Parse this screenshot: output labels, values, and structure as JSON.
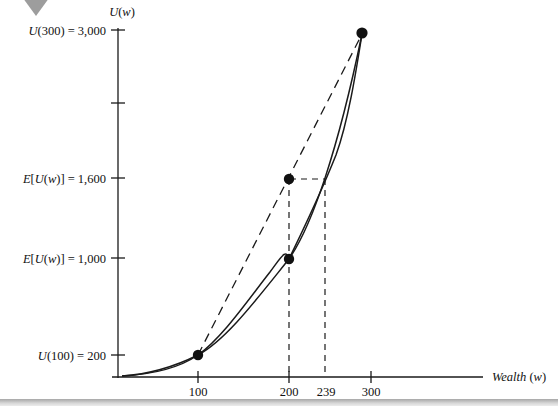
{
  "figure": {
    "decor": {
      "corner_marker": "triangle-down-marker",
      "corner_marker_color": "#9a9a9a",
      "bottom_rule_color": "#b4b4b4"
    },
    "axes": {
      "y_title": "U(w)",
      "x_title": "Wealth (w)",
      "axis_color": "#1a1a1a"
    },
    "y_labels": [
      {
        "id": "u300",
        "text": "U(300) = 3,000",
        "value": 3000
      },
      {
        "id": "eu1600",
        "text": "E[U(w)] = 1,600",
        "value": 1600
      },
      {
        "id": "eu1000",
        "text": "E[U(w)] = 1,000",
        "value": 1000
      },
      {
        "id": "u100",
        "text": "U(100) = 200",
        "value": 200
      }
    ],
    "x_labels": [
      {
        "id": "x100",
        "text": "100",
        "value": 100
      },
      {
        "id": "x200",
        "text": "200",
        "value": 200
      },
      {
        "id": "x239",
        "text": "239",
        "value": 239
      },
      {
        "id": "x300",
        "text": "300",
        "value": 300
      }
    ]
  },
  "chart_data": {
    "type": "line",
    "title": "",
    "subtitle": "",
    "xlabel": "Wealth (w)",
    "ylabel": "U(w)",
    "xlim": [
      0,
      420
    ],
    "ylim": [
      0,
      3300
    ],
    "grid": false,
    "legend": "none",
    "x_ticks": [
      100,
      200,
      300
    ],
    "x_tick_labels": [
      "100",
      "200",
      "300"
    ],
    "y_ticks": [
      200,
      1000,
      1600,
      2300,
      3000
    ],
    "y_tick_labels": [
      "U(100) = 200",
      "E[U(w)] = 1,000",
      "E[U(w)] = 1,600",
      "",
      "U(300) = 3,000"
    ],
    "series": [
      {
        "name": "utility-curve",
        "style": "solid",
        "note": "concave-up (convex) utility function U(w), increasing at increasing rate",
        "x": [
          0,
          20,
          40,
          60,
          80,
          100,
          120,
          140,
          160,
          180,
          200,
          220,
          240,
          260,
          280,
          300,
          310
        ],
        "y": [
          0,
          12,
          40,
          85,
          140,
          200,
          300,
          420,
          560,
          760,
          1000,
          1270,
          1580,
          1950,
          2390,
          2900,
          3180
        ]
      },
      {
        "name": "expected-utility-chord",
        "style": "dashed",
        "note": "straight chord joining (100, 200) and (300, 3000); midpoint is the expected utility",
        "x": [
          100,
          300
        ],
        "y": [
          200,
          3000
        ]
      }
    ],
    "points": [
      {
        "name": "u-at-100",
        "x": 100,
        "y": 200,
        "label": "U(100) = 200"
      },
      {
        "name": "expected-utility-at-200",
        "x": 200,
        "y": 1600,
        "label": "E[U(w)] = 1,600"
      },
      {
        "name": "u-at-200",
        "x": 200,
        "y": 1000,
        "label": "E[U(w)] = 1,000"
      },
      {
        "name": "u-at-300",
        "x": 300,
        "y": 3000,
        "label": "U(300) = 3,000"
      }
    ],
    "guides": [
      {
        "name": "vertical-guide-200",
        "style": "dashed",
        "from": [
          200,
          0
        ],
        "to": [
          200,
          1600
        ]
      },
      {
        "name": "vertical-guide-239",
        "style": "dashed",
        "from": [
          239,
          0
        ],
        "to": [
          239,
          1600
        ]
      },
      {
        "name": "horizontal-guide-1600",
        "style": "dashed",
        "from": [
          200,
          1600
        ],
        "to": [
          239,
          1600
        ]
      }
    ],
    "annotations": [
      {
        "name": "certainty-equivalent",
        "x": 239,
        "text": "239"
      }
    ]
  }
}
